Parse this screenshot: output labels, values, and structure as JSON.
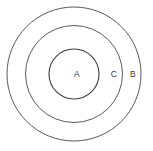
{
  "canvas": {
    "width": 153,
    "height": 151,
    "background_color": "#ffffff"
  },
  "diagram": {
    "type": "concentric-circles",
    "center": {
      "x": 74,
      "y": 74
    },
    "stroke_color_outer": "#5a5a5a",
    "stroke_color_middle": "#5a5a5a",
    "stroke_color_inner": "#3c3c3c",
    "circles": [
      {
        "id": "outer-circle",
        "label": "B",
        "radius": 67,
        "cx": 74,
        "cy": 74,
        "stroke": "#5a5a5a",
        "stroke_width": 1,
        "fill": "none"
      },
      {
        "id": "middle-circle",
        "label": "C",
        "radius": 48.5,
        "cx": 74,
        "cy": 74,
        "stroke": "#5a5a5a",
        "stroke_width": 1,
        "fill": "none"
      },
      {
        "id": "inner-circle",
        "label": "A",
        "radius": 25,
        "cx": 74,
        "cy": 74,
        "stroke": "#3c3c3c",
        "stroke_width": 1.1,
        "fill": "none"
      }
    ],
    "labels": [
      {
        "id": "label-a",
        "text": "A",
        "x": 77,
        "y": 75
      },
      {
        "id": "label-c",
        "text": "C",
        "x": 114,
        "y": 75
      },
      {
        "id": "label-b",
        "text": "B",
        "x": 133,
        "y": 75
      }
    ]
  }
}
